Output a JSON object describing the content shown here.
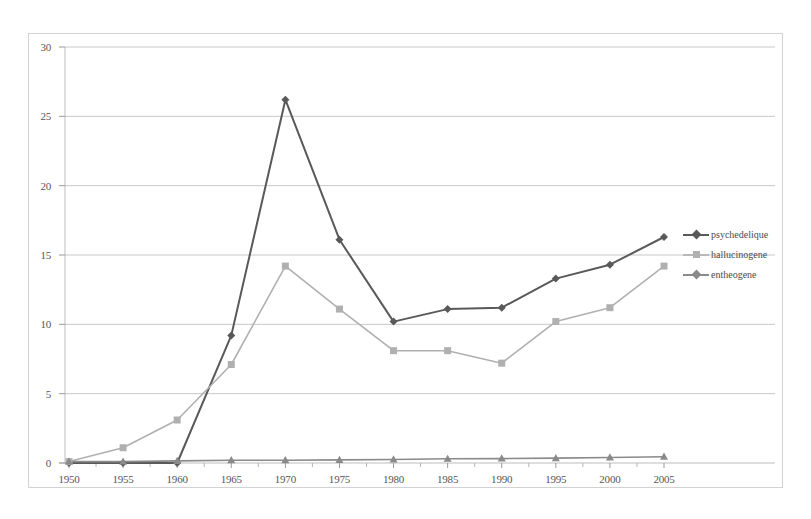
{
  "chart_data": {
    "type": "line",
    "title": "",
    "xlabel": "",
    "ylabel": "",
    "categories": [
      "1950",
      "1955",
      "1960",
      "1965",
      "1970",
      "1975",
      "1980",
      "1985",
      "1990",
      "1995",
      "2000",
      "2005"
    ],
    "xlim": [
      1950,
      2005
    ],
    "ylim": [
      0,
      30
    ],
    "yticks": [
      "0",
      "5",
      "10",
      "15",
      "20",
      "25",
      "30"
    ],
    "grid": true,
    "legend_position": "right",
    "series": [
      {
        "name": "psychedelique",
        "color": "#595959",
        "marker": "diamond",
        "values": [
          0,
          0,
          0,
          9.2,
          26.2,
          16.1,
          10.2,
          11.1,
          11.2,
          13.3,
          14.3,
          16.3
        ]
      },
      {
        "name": "hallucinogene",
        "color": "#b0b0b0",
        "marker": "square",
        "values": [
          0.1,
          1.1,
          3.1,
          7.1,
          14.2,
          11.1,
          8.1,
          8.1,
          7.2,
          10.2,
          11.2,
          14.2
        ]
      },
      {
        "name": "entheogene",
        "color": "#8a8a8a",
        "marker": "triangle",
        "values": [
          0.1,
          0.1,
          0.15,
          0.2,
          0.2,
          0.22,
          0.25,
          0.3,
          0.32,
          0.35,
          0.4,
          0.45
        ]
      }
    ]
  },
  "legend": {
    "items": [
      {
        "label": "psychedelique"
      },
      {
        "label": "hallucinogene"
      },
      {
        "label": "entheogene"
      }
    ]
  },
  "axes": {
    "y_tick_labels": [
      "30",
      "25",
      "20",
      "15",
      "10",
      "5",
      "0"
    ],
    "x_tick_labels": [
      "1950",
      "1955",
      "1960",
      "1965",
      "1970",
      "1975",
      "1980",
      "1985",
      "1990",
      "1995",
      "2000",
      "2005"
    ]
  },
  "colors": {
    "series_1": "#595959",
    "series_2": "#b0b0b0",
    "series_3": "#8a8a8a",
    "gridline": "#c8c8c8",
    "frame": "#d2d2d2",
    "text": "#565656"
  }
}
